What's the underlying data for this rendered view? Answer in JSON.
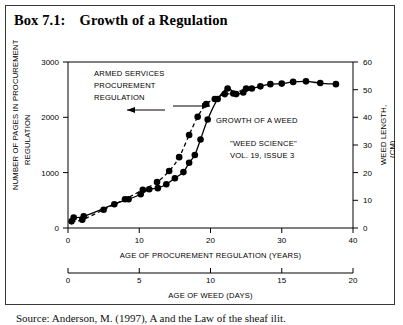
{
  "box": {
    "label": "Box 7.1:",
    "title": "Growth of a Regulation"
  },
  "caption": {
    "text": "Source: Anderson, M. (1997), A and the Law of the sheaf ilit."
  },
  "chart_data": {
    "type": "line",
    "title": "Growth of a Regulation",
    "xlabel": "AGE OF PROCUREMENT REGULATION (YEARS)",
    "xlabel2": "AGE OF WEED (DAYS)",
    "ylabel": "NUMBER OF PAGES IN PROCUREMENT REGULATION",
    "ylabel2": "WEED LENGTH, (CM)",
    "xlim": [
      0,
      40
    ],
    "xlim2": [
      0,
      20
    ],
    "ylim": [
      0,
      3000
    ],
    "ylim2": [
      0,
      60
    ],
    "xticks": [
      0,
      10,
      20,
      30,
      40
    ],
    "xticks2": [
      0,
      5,
      10,
      15,
      20
    ],
    "yticks": [
      0,
      1000,
      2000,
      3000
    ],
    "yticks2": [
      0,
      10,
      20,
      30,
      40,
      50,
      60
    ],
    "grid": false,
    "legend": "none",
    "annotations": [
      "ARMED SERVICES",
      "PROCUREMENT",
      "REGULATION",
      "GROWTH OF A WEED",
      "\"WEED SCIENCE\"",
      "VOL. 19, ISSUE 3"
    ],
    "series": [
      {
        "name": "ARMED SERVICES PROCUREMENT REGULATION",
        "style": "solid",
        "x": [
          0.8,
          2.2,
          6.5,
          8.5,
          10.2,
          11.4,
          12.6,
          13.8,
          15.0,
          16.2,
          17.0,
          17.8,
          18.6,
          19.6,
          21.0,
          22.4,
          23.6,
          24.6,
          25.8,
          27.0,
          28.4,
          30.0,
          31.6,
          33.4,
          35.4,
          37.6
        ],
        "y": [
          190,
          210,
          430,
          520,
          610,
          700,
          720,
          790,
          900,
          1010,
          1180,
          1320,
          1600,
          1960,
          2330,
          2520,
          2420,
          2450,
          2520,
          2560,
          2600,
          2610,
          2640,
          2650,
          2620,
          2600
        ]
      },
      {
        "name": "GROWTH OF A WEED",
        "style": "dashed",
        "x": [
          0.5,
          2.0,
          5.0,
          8.0,
          10.5,
          12.5,
          14.2,
          15.6,
          17.0,
          18.2,
          19.4,
          20.6,
          22.0,
          23.2,
          25.0
        ],
        "y": [
          120,
          150,
          330,
          520,
          690,
          830,
          1030,
          1280,
          1680,
          2010,
          2240,
          2330,
          2420,
          2430,
          2520
        ]
      }
    ]
  }
}
